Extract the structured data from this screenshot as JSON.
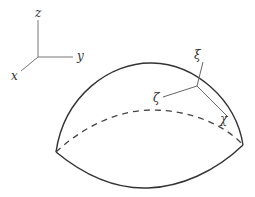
{
  "diagram": {
    "type": "geometry-figure",
    "global_axes": {
      "z_label": "z",
      "y_label": "y",
      "x_label": "x"
    },
    "local_axes": {
      "xi_label": "ξ",
      "zeta_label": "ζ",
      "chi_label": "χ"
    },
    "colors": {
      "stroke": "#333333",
      "axis_stroke": "#666666",
      "background": "#ffffff"
    }
  }
}
